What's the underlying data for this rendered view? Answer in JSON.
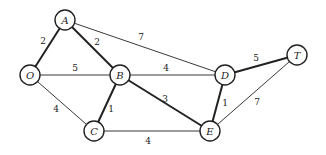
{
  "diagram": {
    "type": "weighted-undirected-graph",
    "nodes": [
      {
        "id": "A",
        "label": "A",
        "x": 65,
        "y": 20
      },
      {
        "id": "O",
        "label": "O",
        "x": 30,
        "y": 75
      },
      {
        "id": "B",
        "label": "B",
        "x": 120,
        "y": 75
      },
      {
        "id": "D",
        "label": "D",
        "x": 225,
        "y": 75
      },
      {
        "id": "T",
        "label": "T",
        "x": 297,
        "y": 55
      },
      {
        "id": "C",
        "label": "C",
        "x": 94,
        "y": 131
      },
      {
        "id": "E",
        "label": "E",
        "x": 210,
        "y": 131
      }
    ],
    "edges": [
      {
        "from": "O",
        "to": "A",
        "weight": "2",
        "bold": true,
        "lx": 43,
        "ly": 41
      },
      {
        "from": "A",
        "to": "B",
        "weight": "2",
        "bold": true,
        "lx": 97,
        "ly": 42
      },
      {
        "from": "A",
        "to": "D",
        "weight": "7",
        "bold": false,
        "lx": 141,
        "ly": 37
      },
      {
        "from": "O",
        "to": "B",
        "weight": "5",
        "bold": false,
        "lx": 75,
        "ly": 68
      },
      {
        "from": "B",
        "to": "D",
        "weight": "4",
        "bold": false,
        "lx": 166,
        "ly": 68
      },
      {
        "from": "D",
        "to": "T",
        "weight": "5",
        "bold": true,
        "lx": 256,
        "ly": 58
      },
      {
        "from": "O",
        "to": "C",
        "weight": "4",
        "bold": false,
        "lx": 56,
        "ly": 109
      },
      {
        "from": "B",
        "to": "C",
        "weight": "1",
        "bold": true,
        "lx": 111,
        "ly": 109
      },
      {
        "from": "B",
        "to": "E",
        "weight": "3",
        "bold": true,
        "lx": 165,
        "ly": 99
      },
      {
        "from": "C",
        "to": "E",
        "weight": "4",
        "bold": false,
        "lx": 148,
        "ly": 141
      },
      {
        "from": "D",
        "to": "E",
        "weight": "1",
        "bold": true,
        "lx": 225,
        "ly": 103
      },
      {
        "from": "E",
        "to": "T",
        "weight": "7",
        "bold": false,
        "lx": 257,
        "ly": 102
      }
    ],
    "node_radius": 10,
    "colors": {
      "stroke": "#222222",
      "background": "#ffffff"
    }
  }
}
